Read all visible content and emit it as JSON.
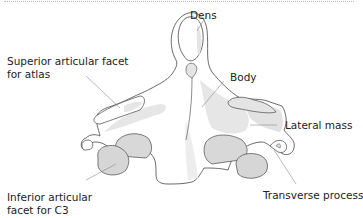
{
  "figure": {
    "colors": {
      "outline": "#5a5a5a",
      "bone_fill": "#ffffff",
      "shade": "#e4e4e4",
      "shade_dark": "#d6d6d6",
      "leader": "#8a8a8a",
      "text": "#222222"
    }
  },
  "labels": {
    "dens": "Dens",
    "superior_facet_line1": "Superior articular facet",
    "superior_facet_line2": "for atlas",
    "body": "Body",
    "lateral_mass": "Lateral mass",
    "inferior_facet_line1": "Inferior articular",
    "inferior_facet_line2": "facet for C3",
    "transverse_process": "Transverse process"
  }
}
